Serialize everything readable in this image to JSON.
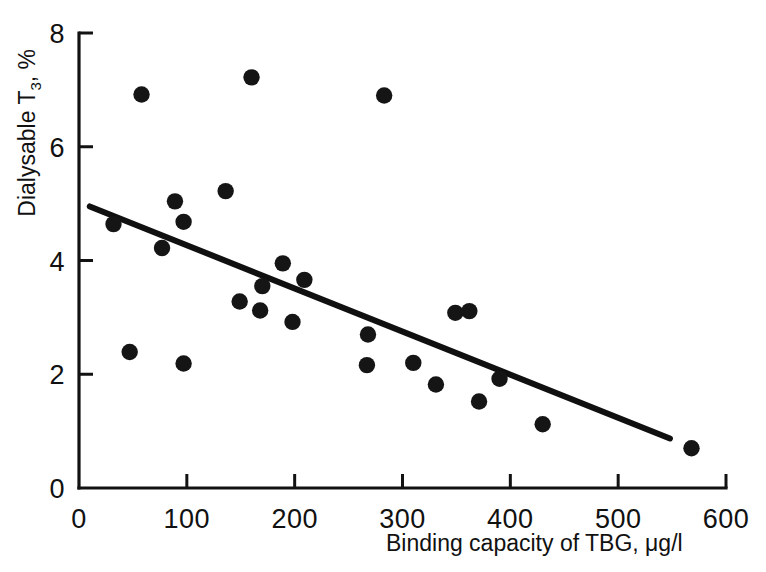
{
  "chart_data": {
    "type": "scatter",
    "title": "",
    "xlabel": "Binding capacity of TBG, μg/l",
    "ylabel": "Dialysable T3, %",
    "ylabel_prefix": "Dialysable T",
    "ylabel_sub": "3",
    "ylabel_suffix": ", %",
    "xlabel_prefix": "Binding capacity of TBG, ",
    "xlabel_units": "μg/l",
    "xlim": [
      0,
      600
    ],
    "ylim": [
      0,
      8
    ],
    "xticks": [
      0,
      100,
      200,
      300,
      400,
      500,
      600
    ],
    "yticks": [
      0,
      2,
      4,
      6,
      8
    ],
    "xticklabels": [
      "0",
      "100",
      "200",
      "300",
      "400",
      "500",
      "600"
    ],
    "yticklabels": [
      "0",
      "2",
      "4",
      "6",
      "8"
    ],
    "grid": false,
    "legend": null,
    "marker_color": "#151515",
    "line_color": "#101010",
    "points": [
      {
        "x": 32,
        "y": 4.64
      },
      {
        "x": 47,
        "y": 2.39
      },
      {
        "x": 58,
        "y": 6.92
      },
      {
        "x": 77,
        "y": 4.22
      },
      {
        "x": 89,
        "y": 5.04
      },
      {
        "x": 97,
        "y": 4.68
      },
      {
        "x": 97,
        "y": 2.19
      },
      {
        "x": 136,
        "y": 5.22
      },
      {
        "x": 149,
        "y": 3.28
      },
      {
        "x": 160,
        "y": 7.22
      },
      {
        "x": 168,
        "y": 3.12
      },
      {
        "x": 170,
        "y": 3.55
      },
      {
        "x": 189,
        "y": 3.95
      },
      {
        "x": 198,
        "y": 2.92
      },
      {
        "x": 209,
        "y": 3.66
      },
      {
        "x": 267,
        "y": 2.16
      },
      {
        "x": 268,
        "y": 2.7
      },
      {
        "x": 283,
        "y": 6.9
      },
      {
        "x": 310,
        "y": 2.2
      },
      {
        "x": 331,
        "y": 1.82
      },
      {
        "x": 349,
        "y": 3.08
      },
      {
        "x": 362,
        "y": 3.11
      },
      {
        "x": 371,
        "y": 1.52
      },
      {
        "x": 390,
        "y": 1.92
      },
      {
        "x": 430,
        "y": 1.12
      },
      {
        "x": 568,
        "y": 0.7
      }
    ],
    "fit_line": {
      "label": "regression line",
      "x_start": 10,
      "y_start": 4.95,
      "x_end": 548,
      "y_end": 0.87
    }
  }
}
